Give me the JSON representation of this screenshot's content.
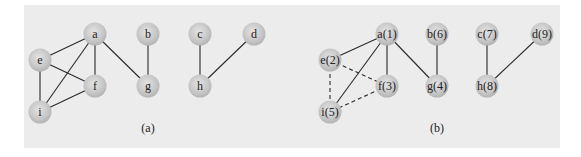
{
  "figure": {
    "background_color": "#ececec",
    "node_color": "#c8c8c8",
    "edge_color": "#2a2a2a",
    "node_radius": 11.5
  },
  "panels": [
    {
      "id": "a",
      "caption": "(a)",
      "caption_pos": [
        148,
        128
      ],
      "nodes": [
        {
          "id": "a",
          "label": "a",
          "x": 95,
          "y": 34
        },
        {
          "id": "b",
          "label": "b",
          "x": 148,
          "y": 34
        },
        {
          "id": "c",
          "label": "c",
          "x": 200,
          "y": 34
        },
        {
          "id": "d",
          "label": "d",
          "x": 254,
          "y": 34
        },
        {
          "id": "e",
          "label": "e",
          "x": 40,
          "y": 60
        },
        {
          "id": "f",
          "label": "f",
          "x": 95,
          "y": 86
        },
        {
          "id": "g",
          "label": "g",
          "x": 148,
          "y": 86
        },
        {
          "id": "h",
          "label": "h",
          "x": 200,
          "y": 86
        },
        {
          "id": "i",
          "label": "i",
          "x": 40,
          "y": 112
        }
      ],
      "edges": [
        {
          "from": "a",
          "to": "e",
          "style": "solid"
        },
        {
          "from": "a",
          "to": "f",
          "style": "solid"
        },
        {
          "from": "a",
          "to": "i",
          "style": "solid"
        },
        {
          "from": "a",
          "to": "g",
          "style": "solid"
        },
        {
          "from": "e",
          "to": "f",
          "style": "solid"
        },
        {
          "from": "e",
          "to": "i",
          "style": "solid"
        },
        {
          "from": "f",
          "to": "i",
          "style": "solid"
        },
        {
          "from": "b",
          "to": "g",
          "style": "solid"
        },
        {
          "from": "c",
          "to": "h",
          "style": "solid"
        },
        {
          "from": "d",
          "to": "h",
          "style": "solid"
        }
      ]
    },
    {
      "id": "b",
      "caption": "(b)",
      "caption_pos": [
        437,
        128
      ],
      "nodes": [
        {
          "id": "a",
          "label": "a(1)",
          "x": 387,
          "y": 34
        },
        {
          "id": "b",
          "label": "b(6)",
          "x": 437,
          "y": 34
        },
        {
          "id": "c",
          "label": "c(7)",
          "x": 487,
          "y": 34
        },
        {
          "id": "d",
          "label": "d(9)",
          "x": 542,
          "y": 34
        },
        {
          "id": "e",
          "label": "e(2)",
          "x": 330,
          "y": 60
        },
        {
          "id": "f",
          "label": "f(3)",
          "x": 387,
          "y": 86
        },
        {
          "id": "g",
          "label": "g(4)",
          "x": 437,
          "y": 86
        },
        {
          "id": "h",
          "label": "h(8)",
          "x": 487,
          "y": 86
        },
        {
          "id": "i",
          "label": "i(5)",
          "x": 330,
          "y": 112
        }
      ],
      "edges": [
        {
          "from": "a",
          "to": "e",
          "style": "solid"
        },
        {
          "from": "a",
          "to": "f",
          "style": "solid"
        },
        {
          "from": "a",
          "to": "i",
          "style": "solid"
        },
        {
          "from": "a",
          "to": "g",
          "style": "solid"
        },
        {
          "from": "e",
          "to": "f",
          "style": "dashed"
        },
        {
          "from": "e",
          "to": "i",
          "style": "dashed"
        },
        {
          "from": "f",
          "to": "i",
          "style": "dashed"
        },
        {
          "from": "b",
          "to": "g",
          "style": "solid"
        },
        {
          "from": "c",
          "to": "h",
          "style": "solid"
        },
        {
          "from": "d",
          "to": "h",
          "style": "solid"
        }
      ]
    }
  ]
}
